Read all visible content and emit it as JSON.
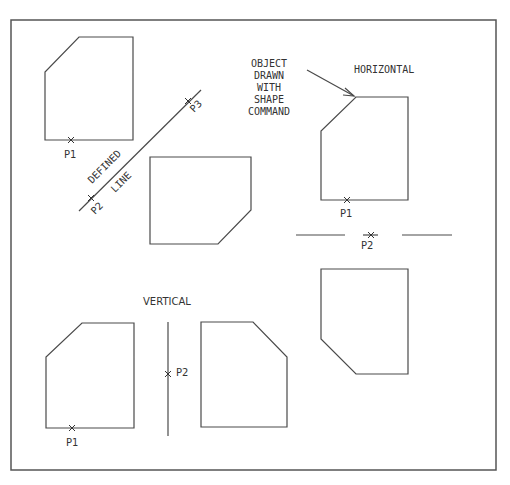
{
  "diagram": {
    "colors": {
      "line": "#4a4a4a",
      "text": "#333333",
      "background": "#ffffff"
    },
    "labels": {
      "defined": "DEFINED",
      "line": "LINE",
      "p1": "P1",
      "p2": "P2",
      "p3": "P3",
      "horizontal": "HORIZONTAL",
      "vertical": "VERTICAL",
      "callout": [
        "OBJECT",
        "DRAWN",
        "WITH",
        "SHAPE",
        "COMMAND"
      ]
    },
    "sections": [
      {
        "name": "defined-line",
        "mirror_line": "diagonal",
        "points": [
          "P1",
          "P2",
          "P3"
        ]
      },
      {
        "name": "horizontal",
        "mirror_line": "horizontal",
        "points": [
          "P1",
          "P2"
        ]
      },
      {
        "name": "vertical",
        "mirror_line": "vertical",
        "points": [
          "P1",
          "P2"
        ]
      }
    ]
  }
}
